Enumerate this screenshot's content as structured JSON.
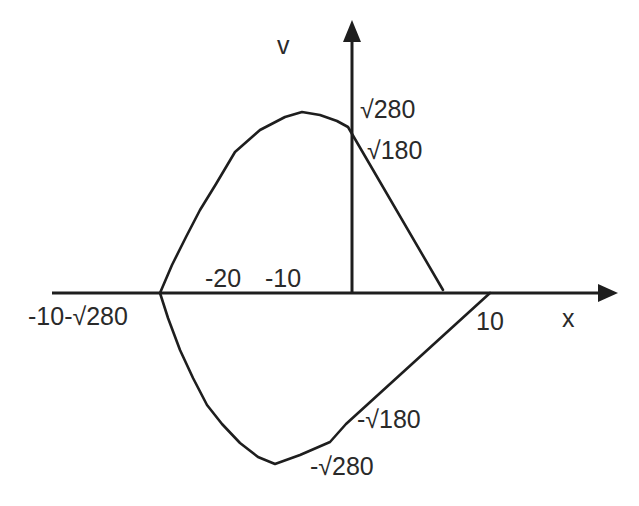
{
  "diagram": {
    "type": "phase-portrait",
    "axes": {
      "x_label": "x",
      "y_label": "v"
    },
    "x_tick_labels": {
      "left_intercept": "-10-√280",
      "minus20": "-20",
      "minus10": "-10",
      "ten": "10"
    },
    "y_tick_labels": {
      "pos_sqrt280": "√280",
      "pos_sqrt180": "√180",
      "neg_sqrt180": "-√180",
      "neg_sqrt280": "-√280"
    },
    "colors": {
      "stroke": "#1e1e1e",
      "text": "#2a2a2a",
      "background": "#ffffff"
    }
  }
}
